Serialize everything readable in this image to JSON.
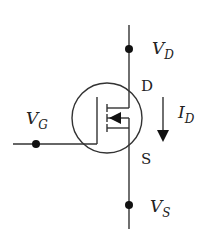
{
  "diagram": {
    "type": "n-channel MOSFET symbol",
    "colors": {
      "stroke": "#333333",
      "background": "#ffffff"
    },
    "terminals": {
      "drain": {
        "letter": "D",
        "voltage_main": "V",
        "voltage_sub": "D"
      },
      "gate": {
        "voltage_main": "V",
        "voltage_sub": "G"
      },
      "source": {
        "letter": "S",
        "voltage_main": "V",
        "voltage_sub": "S"
      }
    },
    "current": {
      "main": "I",
      "sub": "D",
      "direction": "down"
    }
  }
}
